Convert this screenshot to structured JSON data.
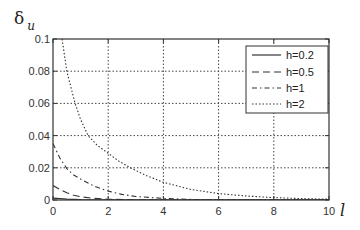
{
  "chart_data": {
    "type": "line",
    "title": "",
    "xlabel": "l",
    "ylabel": "δ",
    "ylabel_subscript": "u",
    "xlim": [
      0,
      10
    ],
    "ylim": [
      0,
      0.1
    ],
    "grid": true,
    "legend_position": "upper right",
    "x_ticks": [
      0,
      2,
      4,
      6,
      8,
      10
    ],
    "x_tick_labels": [
      "0",
      "2",
      "4",
      "6",
      "8",
      "10"
    ],
    "y_ticks": [
      0,
      0.02,
      0.04,
      0.06,
      0.08,
      0.1
    ],
    "y_tick_labels": [
      "0",
      "0.02",
      "0.04",
      "0.06",
      "0.08",
      "0.1"
    ],
    "series": [
      {
        "name": "h=0.2",
        "style": "solid",
        "x": [
          0,
          0.5,
          1,
          1.5,
          2,
          3,
          4,
          6,
          8,
          10
        ],
        "y": [
          0.0012,
          0.0005,
          0.0002,
          0.0001,
          5e-05,
          0,
          0,
          0,
          0,
          0
        ]
      },
      {
        "name": "h=0.5",
        "style": "dashed",
        "x": [
          0,
          0.25,
          0.5,
          0.75,
          1,
          1.5,
          2,
          3,
          4,
          6,
          8,
          10
        ],
        "y": [
          0.009,
          0.0065,
          0.0045,
          0.003,
          0.002,
          0.001,
          0.0005,
          0.0001,
          0,
          0,
          0,
          0
        ]
      },
      {
        "name": "h=1",
        "style": "dashdot",
        "x": [
          0,
          0.25,
          0.5,
          0.75,
          1,
          1.5,
          2,
          2.5,
          3,
          4,
          5,
          6,
          8,
          10
        ],
        "y": [
          0.035,
          0.026,
          0.0195,
          0.0155,
          0.013,
          0.0085,
          0.0055,
          0.0035,
          0.0022,
          0.001,
          0.0004,
          0.0002,
          0,
          0
        ]
      },
      {
        "name": "h=2",
        "style": "dotted",
        "x": [
          0.33,
          0.5,
          0.8,
          1.0,
          1.27,
          1.6,
          2.0,
          2.4,
          2.8,
          3.4,
          4.0,
          5.0,
          6.0,
          7.0,
          8.0,
          9.0,
          10.0
        ],
        "y": [
          0.1,
          0.08,
          0.06,
          0.05,
          0.04,
          0.034,
          0.029,
          0.024,
          0.02,
          0.015,
          0.011,
          0.0065,
          0.004,
          0.0025,
          0.0015,
          0.0009,
          0.0005
        ]
      }
    ]
  },
  "legend": {
    "items": [
      {
        "label": "h=0.2",
        "style": "solid"
      },
      {
        "label": "h=0.5",
        "style": "dashed"
      },
      {
        "label": "h=1",
        "style": "dashdot"
      },
      {
        "label": "h=2",
        "style": "dotted"
      }
    ]
  },
  "colors": {
    "line": "#333333",
    "grid": "#444444",
    "axes": "#333333",
    "background": "#ffffff"
  }
}
